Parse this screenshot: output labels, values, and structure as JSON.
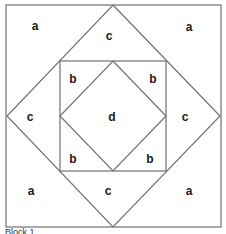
{
  "diagram": {
    "stroke_color": "#707070",
    "outer_square": {
      "x1": 6,
      "y1": 5,
      "x2": 221,
      "y2": 227
    },
    "diamond": [
      [
        113,
        5
      ],
      [
        220,
        116
      ],
      [
        113,
        227
      ],
      [
        7,
        116
      ]
    ],
    "inner_square": {
      "x1": 60,
      "y1": 61,
      "x2": 166,
      "y2": 171
    },
    "inner_diamond": [
      [
        113,
        61
      ],
      [
        166,
        116
      ],
      [
        113,
        171
      ],
      [
        60,
        116
      ]
    ],
    "labels": [
      {
        "text": "a",
        "x": 35,
        "y": 26
      },
      {
        "text": "c",
        "x": 109,
        "y": 36
      },
      {
        "text": "a",
        "x": 189,
        "y": 27
      },
      {
        "text": "b",
        "x": 73,
        "y": 79
      },
      {
        "text": "b",
        "x": 153,
        "y": 79
      },
      {
        "text": "c",
        "x": 30,
        "y": 117
      },
      {
        "text": "d",
        "x": 112,
        "y": 117
      },
      {
        "text": "c",
        "x": 185,
        "y": 117
      },
      {
        "text": "b",
        "x": 73,
        "y": 159
      },
      {
        "text": "b",
        "x": 150,
        "y": 159
      },
      {
        "text": "a",
        "x": 31,
        "y": 191
      },
      {
        "text": "c",
        "x": 108,
        "y": 191
      },
      {
        "text": "a",
        "x": 189,
        "y": 191
      }
    ],
    "caption": "Block 1"
  }
}
